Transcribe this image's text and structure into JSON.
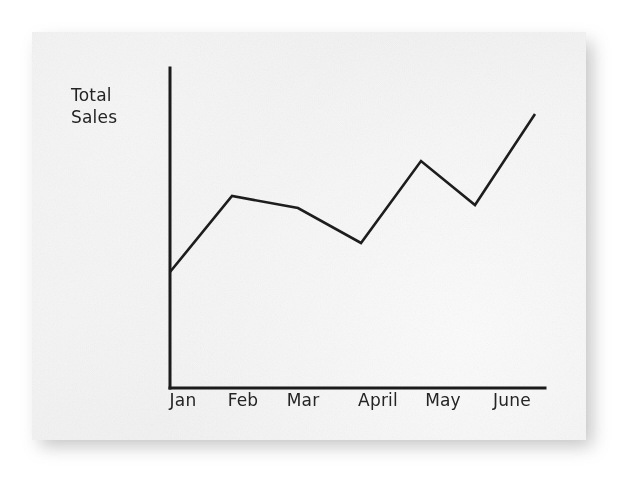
{
  "figure": {
    "background_color": "#ffffff",
    "paper_color": "#f1f1f1",
    "ink_color": "#1d1d1d"
  },
  "chart_data": {
    "type": "line",
    "title": "",
    "subtitle": "",
    "xlabel": "",
    "ylabel": "Total\nSales",
    "ylabel_lines": [
      "Total",
      "Sales"
    ],
    "categories": [
      "Jan",
      "Feb",
      "Mar",
      "April",
      "May",
      "June"
    ],
    "series": [
      {
        "name": "Total Sales",
        "color": "#1d1d1d",
        "values": [
          32,
          60,
          56,
          44,
          72,
          89
        ],
        "vertices_px": [
          {
            "label": "Jan",
            "x": 170,
            "y": 272
          },
          {
            "label": "Feb",
            "x": 232,
            "y": 196
          },
          {
            "label": "Mar",
            "x": 298,
            "y": 208
          },
          {
            "label": "April",
            "x": 361,
            "y": 243
          },
          {
            "label": "May",
            "x": 421,
            "y": 161
          },
          {
            "label": "dip",
            "x": 475,
            "y": 205
          },
          {
            "label": "June",
            "x": 535,
            "y": 114
          }
        ]
      }
    ],
    "axis": {
      "x_axis_y_px": 388,
      "y_axis_x_px": 170,
      "x_axis_end_px": 545,
      "y_axis_top_px": 68,
      "x_tick_positions_px": [
        183,
        243,
        303,
        378,
        443,
        512
      ],
      "grid": false,
      "tick_marks": false,
      "y_tick_labels": [],
      "ylim": [
        0,
        100
      ],
      "legend": "none"
    },
    "annotations": []
  }
}
